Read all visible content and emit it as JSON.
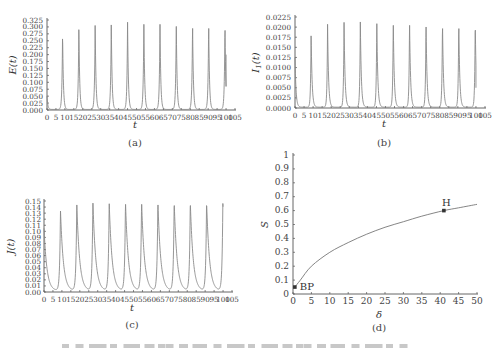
{
  "figure": {
    "caption_partial": "(caption text cut off at bottom edge — illegible)"
  },
  "chart_data": [
    {
      "id": "a",
      "type": "line",
      "subtitle": "(a)",
      "xlabel": "t",
      "ylabel": "E(t)",
      "xlim": [
        0,
        105
      ],
      "ylim": [
        0,
        0.325
      ],
      "xticks": [
        0,
        5,
        10,
        15,
        20,
        25,
        30,
        35,
        40,
        45,
        50,
        55,
        60,
        65,
        70,
        75,
        80,
        85,
        90,
        95,
        100,
        105
      ],
      "yticks": [
        0.0,
        0.025,
        0.05,
        0.075,
        0.1,
        0.125,
        0.15,
        0.175,
        0.2,
        0.225,
        0.25,
        0.275,
        0.3,
        0.325
      ],
      "ytick_labels": [
        "0.000",
        "0.025",
        "0.050",
        "0.075",
        "0.100",
        "0.125",
        "0.150",
        "0.175",
        "0.200",
        "0.225",
        "0.250",
        "0.275",
        "0.300",
        "0.325"
      ],
      "description": "Periodic sharp spikes; near-zero baseline between spikes",
      "peaks": {
        "t": [
          0,
          8.7,
          17.8,
          26.9,
          35.9,
          45.0,
          54.1,
          63.1,
          72.2,
          81.3,
          90.3,
          99.4
        ],
        "value": [
          0.05,
          0.28,
          0.307,
          0.313,
          0.315,
          0.315,
          0.315,
          0.315,
          0.315,
          0.315,
          0.315,
          0.315
        ]
      },
      "end_value": 0.2,
      "grid": false
    },
    {
      "id": "b",
      "type": "line",
      "subtitle": "(b)",
      "xlabel": "t",
      "ylabel": "I1(t)",
      "xlim": [
        0,
        105
      ],
      "ylim": [
        0,
        0.0225
      ],
      "xticks": [
        0,
        5,
        10,
        15,
        20,
        25,
        30,
        35,
        40,
        45,
        50,
        55,
        60,
        65,
        70,
        75,
        80,
        85,
        90,
        95,
        100,
        105
      ],
      "yticks": [
        0.0,
        0.0025,
        0.005,
        0.0075,
        0.01,
        0.0125,
        0.015,
        0.0175,
        0.02,
        0.0225
      ],
      "ytick_labels": [
        "0.0000",
        "0.0025",
        "0.0050",
        "0.0075",
        "0.0100",
        "0.0125",
        "0.0150",
        "0.0175",
        "0.0200",
        "0.0225"
      ],
      "description": "Periodic spikes, initial value ~0.0125 decaying to baseline",
      "initial_value": 0.0125,
      "peaks": {
        "t": [
          8.9,
          18.0,
          27.1,
          36.1,
          45.2,
          54.3,
          63.3,
          72.4,
          81.5,
          90.5,
          99.6
        ],
        "value": [
          0.0183,
          0.0205,
          0.0214,
          0.0215,
          0.0215,
          0.0215,
          0.0215,
          0.0215,
          0.0215,
          0.0215,
          0.0215
        ]
      },
      "end_value": 0.005,
      "grid": false
    },
    {
      "id": "c",
      "type": "line",
      "subtitle": "(c)",
      "xlabel": "t",
      "ylabel": "J(t)",
      "xlim": [
        0,
        105
      ],
      "ylim": [
        0,
        0.15
      ],
      "xticks": [
        0,
        5,
        10,
        15,
        20,
        25,
        30,
        35,
        40,
        45,
        50,
        55,
        60,
        65,
        70,
        75,
        80,
        85,
        90,
        95,
        100,
        105
      ],
      "yticks": [
        0.0,
        0.01,
        0.02,
        0.03,
        0.04,
        0.05,
        0.06,
        0.07,
        0.08,
        0.09,
        0.1,
        0.11,
        0.12,
        0.13,
        0.14,
        0.15
      ],
      "ytick_labels": [
        "0.00",
        "0.01",
        "0.02",
        "0.03",
        "0.04",
        "0.05",
        "0.06",
        "0.07",
        "0.08",
        "0.09",
        "0.10",
        "0.11",
        "0.12",
        "0.13",
        "0.14",
        "0.15"
      ],
      "description": "Periodic peaks with slower exponential-like decay after each peak",
      "initial_value": 0.105,
      "peaks": {
        "t": [
          9.2,
          18.3,
          27.3,
          36.4,
          45.5,
          54.5,
          63.6,
          72.7,
          81.7,
          90.8,
          99.9
        ],
        "value": [
          0.133,
          0.144,
          0.147,
          0.147,
          0.147,
          0.147,
          0.147,
          0.147,
          0.147,
          0.147,
          0.147
        ]
      },
      "grid": false
    },
    {
      "id": "d",
      "type": "line",
      "subtitle": "(d)",
      "xlabel": "δ",
      "ylabel": "S",
      "xlim": [
        0,
        50
      ],
      "ylim": [
        0,
        1
      ],
      "xticks": [
        0,
        5,
        10,
        15,
        20,
        25,
        30,
        35,
        40,
        45,
        50
      ],
      "yticks": [
        0,
        0.1,
        0.2,
        0.3,
        0.4,
        0.5,
        0.6,
        0.7,
        0.8,
        0.9,
        1
      ],
      "ytick_labels": [
        "0",
        "0.1",
        "0.2",
        "0.3",
        "0.4",
        "0.5",
        "0.6",
        "0.7",
        "0.8",
        "0.9",
        "1"
      ],
      "series": [
        {
          "name": "S equilibrium branch",
          "x": [
            0.5,
            2,
            5,
            10,
            15,
            20,
            25,
            30,
            35,
            41,
            45,
            50
          ],
          "y": [
            0.05,
            0.1,
            0.2,
            0.3,
            0.37,
            0.43,
            0.48,
            0.52,
            0.56,
            0.6,
            0.62,
            0.645
          ]
        }
      ],
      "annotations": [
        {
          "label": "BP",
          "x": 0.5,
          "y": 0.05
        },
        {
          "label": "H",
          "x": 41,
          "y": 0.6
        }
      ],
      "grid": false
    }
  ]
}
